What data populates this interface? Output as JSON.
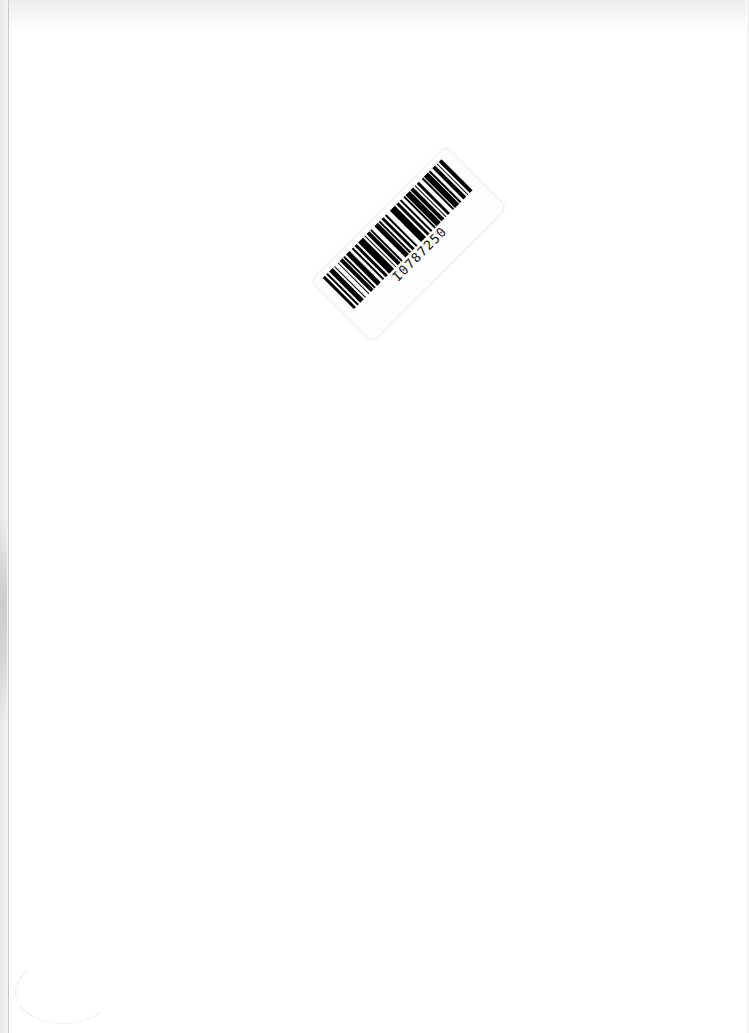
{
  "document": {
    "type": "scanned blank page",
    "barcode_label": {
      "text": "I0787250",
      "rotation_deg": -45
    }
  },
  "colors": {
    "background": "#ffffff",
    "barcode": "#000000",
    "edge_shadow": "#c8c8c8"
  },
  "barcode_pattern": [
    2,
    1,
    1,
    1,
    3,
    1,
    1,
    2,
    1,
    1,
    2,
    1,
    1,
    1,
    3,
    2,
    1,
    1,
    2,
    1,
    4,
    1,
    1,
    1,
    2,
    1,
    1,
    2,
    3,
    1,
    1,
    1,
    2,
    1,
    1,
    3,
    4,
    1,
    2,
    1,
    1,
    2,
    1,
    1,
    3,
    1,
    2,
    1,
    1,
    1,
    2,
    2,
    1,
    1,
    3,
    1,
    1,
    2,
    2,
    1,
    1,
    1,
    2,
    1
  ]
}
